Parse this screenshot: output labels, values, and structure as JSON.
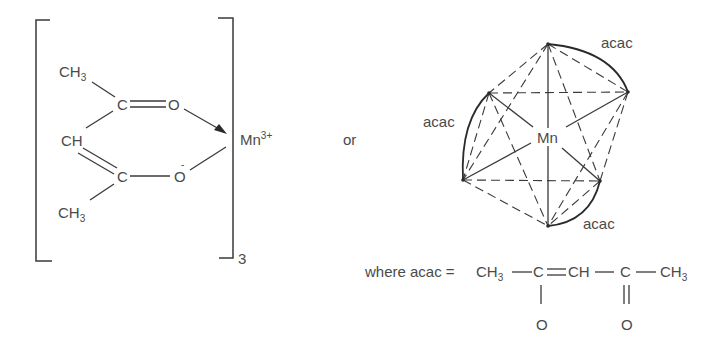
{
  "left_structure": {
    "ch3_top": "CH",
    "ch3_top_sub": "3",
    "c_upper": "C",
    "o_upper": "O",
    "ch_middle": "CH",
    "c_lower": "C",
    "o_lower": "O",
    "o_lower_charge": "-",
    "ch3_bottom": "CH",
    "ch3_bottom_sub": "3",
    "metal": "Mn",
    "metal_charge": "3+",
    "bracket_subscript": "3"
  },
  "connector": "or",
  "octahedron": {
    "center_label": "Mn",
    "ligand_labels": [
      "acac",
      "acac",
      "acac"
    ]
  },
  "definition": {
    "prefix": "where acac =",
    "ch3_left": "CH",
    "ch3_left_sub": "3",
    "c1": "C",
    "ch": "CH",
    "c2": "C",
    "ch3_right": "CH",
    "ch3_right_sub": "3",
    "o1": "O",
    "o2": "O"
  },
  "colors": {
    "text": "#4a4a4a",
    "lines": "#3a3a3a",
    "background": "#ffffff"
  }
}
